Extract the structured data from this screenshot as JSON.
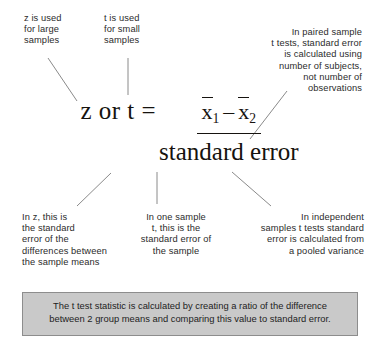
{
  "diagram": {
    "formula": {
      "lhs": "z or t =",
      "numerator_first_term": "x",
      "numerator_first_sub": "1",
      "numerator_operator": "–",
      "numerator_second_term": "x",
      "numerator_second_sub": "2",
      "denominator": "standard error"
    },
    "annotations": [
      {
        "id": "z-large-samples",
        "text": "z is used\nfor large\nsamples",
        "align": "left"
      },
      {
        "id": "t-small-samples",
        "text": "t is used\nfor small\nsamples",
        "align": "left"
      },
      {
        "id": "paired-sample",
        "text": "In paired sample\nt tests, standard error\nis calculated using\nnumber of subjects,\nnot number of\nobservations",
        "align": "right"
      },
      {
        "id": "in-z-standard-error",
        "text": "In z, this is\nthe standard\nerror of the\ndifferences between\nthe sample means",
        "align": "left"
      },
      {
        "id": "one-sample-t",
        "text": "In one sample\nt, this is the\nstandard error of\nthe sample",
        "align": "center"
      },
      {
        "id": "independent-samples",
        "text": "In independent\nsamples t tests standard\nerror is calculated from\na pooled variance",
        "align": "right"
      }
    ],
    "caption": "The t test statistic is calculated by creating a ratio of the difference\nbetween 2 group means and comparing this value to standard error."
  },
  "colors": {
    "text": "#2b2b2b",
    "formula": "#16130f",
    "leader_line": "#8a8a8a",
    "caption_fill": "#c9c9c9",
    "caption_border": "#8d8d8d",
    "background": "#ffffff"
  }
}
